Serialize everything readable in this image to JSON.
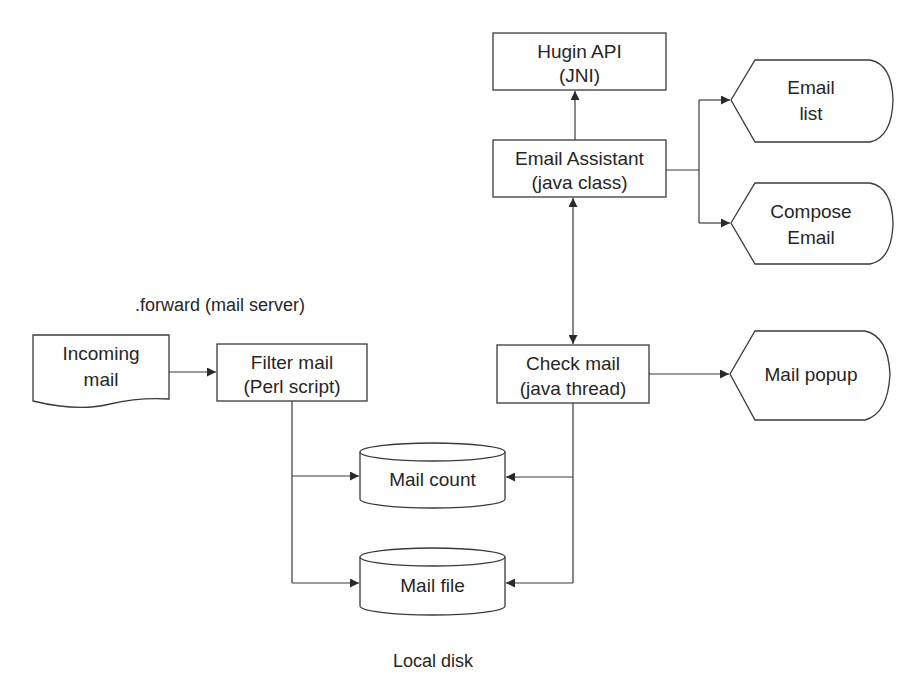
{
  "diagram": {
    "type": "flowchart",
    "nodes": {
      "hugin_api": {
        "line1": "Hugin API",
        "line2": "(JNI)",
        "shape": "rectangle"
      },
      "email_assistant": {
        "line1": "Email Assistant",
        "line2": "(java class)",
        "shape": "rectangle"
      },
      "email_list": {
        "line1": "Email",
        "line2": "list",
        "shape": "display"
      },
      "compose_email": {
        "line1": "Compose",
        "line2": "Email",
        "shape": "display"
      },
      "incoming_mail": {
        "line1": "Incoming",
        "line2": "mail",
        "shape": "document"
      },
      "filter_mail": {
        "line1": "Filter mail",
        "line2": "(Perl script)",
        "shape": "rectangle"
      },
      "check_mail": {
        "line1": "Check mail",
        "line2": "(java thread)",
        "shape": "rectangle"
      },
      "mail_popup": {
        "line1": "Mail popup",
        "shape": "display"
      },
      "mail_count": {
        "line1": "Mail count",
        "shape": "cylinder"
      },
      "mail_file": {
        "line1": "Mail file",
        "shape": "cylinder"
      }
    },
    "annotations": {
      "forward": ".forward (mail server)",
      "local_disk": "Local disk"
    },
    "edges": [
      {
        "from": "Email Assistant",
        "to": "Hugin API"
      },
      {
        "from": "Email Assistant",
        "to": "Email list"
      },
      {
        "from": "Email Assistant",
        "to": "Compose Email"
      },
      {
        "from": "Email Assistant",
        "to": "Check mail",
        "bidirectional": true
      },
      {
        "from": "Incoming mail",
        "to": "Filter mail"
      },
      {
        "from": "Check mail",
        "to": "Mail popup"
      },
      {
        "from": "Filter mail",
        "to": "Mail count"
      },
      {
        "from": "Filter mail",
        "to": "Mail file"
      },
      {
        "from": "Check mail",
        "to": "Mail count"
      },
      {
        "from": "Check mail",
        "to": "Mail file"
      }
    ],
    "colors": {
      "stroke": "#3a3a3a",
      "text": "#262626",
      "background": "#ffffff"
    }
  }
}
